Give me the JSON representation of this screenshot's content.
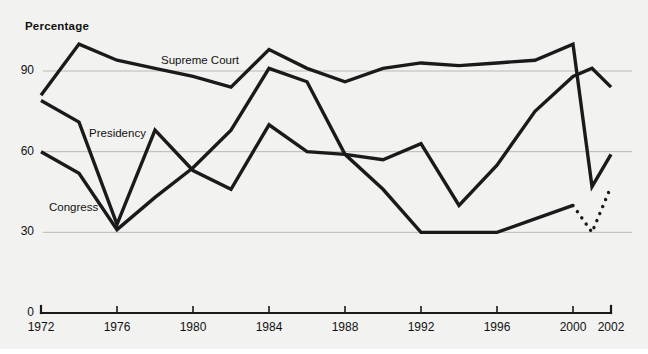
{
  "chart_data": {
    "type": "line",
    "title": "Percentage",
    "xlabel": "",
    "ylabel": "Percentage",
    "xlim": [
      1972,
      2002
    ],
    "ylim": [
      0,
      105
    ],
    "grid": "horizontal",
    "legend": "inline-labels",
    "y_ticks": [
      "0",
      "30",
      "60",
      "90"
    ],
    "y_tick_values": [
      0,
      30,
      60,
      90
    ],
    "x_ticks": [
      "1972",
      "1976",
      "1980",
      "1984",
      "1988",
      "1992",
      "1996",
      "2000",
      "2002"
    ],
    "x_tick_values": [
      1972,
      1976,
      1980,
      1984,
      1988,
      1992,
      1996,
      2000,
      2002
    ],
    "series": [
      {
        "name": "Supreme Court",
        "label_text": "Supreme Court",
        "style": "solid",
        "x": [
          1972,
          1974,
          1976,
          1978,
          1980,
          1982,
          1984,
          1986,
          1988,
          1990,
          1992,
          1994,
          1996,
          1998,
          2000,
          2001,
          2002
        ],
        "values": [
          81,
          100,
          94,
          91,
          88,
          84,
          98,
          91,
          86,
          91,
          93,
          92,
          93,
          94,
          100,
          47,
          59
        ]
      },
      {
        "name": "Presidency",
        "label_text": "Presidency",
        "style": "solid",
        "x": [
          1972,
          1974,
          1976,
          1978,
          1980,
          1982,
          1984,
          1986,
          1988,
          1990,
          1992,
          1994,
          1996,
          1998,
          2000,
          2001,
          2002
        ],
        "values": [
          79,
          71,
          33,
          68,
          53,
          46,
          70,
          60,
          59,
          57,
          63,
          40,
          55,
          75,
          88,
          91,
          84
        ]
      },
      {
        "name": "Congress",
        "label_text": "Congress",
        "style": "solid",
        "x": [
          1972,
          1974,
          1976,
          1978,
          1980,
          1982,
          1984,
          1986,
          1988,
          1990,
          1992,
          1994,
          1996,
          1998,
          2000
        ],
        "values": [
          60,
          52,
          31,
          43,
          54,
          68,
          91,
          86,
          59,
          46,
          30,
          30,
          30,
          35,
          40
        ]
      },
      {
        "name": "Congress-projected",
        "label_text": "",
        "style": "dotted",
        "x": [
          2000,
          2001,
          2002
        ],
        "values": [
          40,
          30,
          47
        ]
      }
    ],
    "colors": {
      "line": "#1a1a1a",
      "grid": "#a9a9a5",
      "background": "#f2f2f0",
      "text": "#111111"
    },
    "series_labels": [
      {
        "text": "Supreme Court",
        "x_px": 161,
        "y_px": 54
      },
      {
        "text": "Presidency",
        "x_px": 89,
        "y_px": 127
      },
      {
        "text": "Congress",
        "x_px": 49,
        "y_px": 201
      }
    ]
  }
}
